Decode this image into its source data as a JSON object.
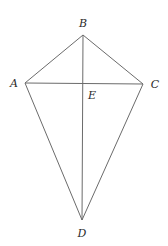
{
  "diagram": {
    "type": "kite",
    "points": {
      "A": {
        "label": "A",
        "x": 25,
        "y": 83,
        "label_x": 14,
        "label_y": 87
      },
      "B": {
        "label": "B",
        "x": 83,
        "y": 35,
        "label_x": 83,
        "label_y": 27
      },
      "C": {
        "label": "C",
        "x": 143,
        "y": 84,
        "label_x": 155,
        "label_y": 88
      },
      "D": {
        "label": "D",
        "x": 82,
        "y": 220,
        "label_x": 82,
        "label_y": 237
      },
      "E": {
        "label": "E",
        "x": 83,
        "y": 83,
        "label_x": 92,
        "label_y": 99
      }
    },
    "segments": [
      [
        "A",
        "B"
      ],
      [
        "B",
        "C"
      ],
      [
        "C",
        "D"
      ],
      [
        "D",
        "A"
      ],
      [
        "A",
        "C"
      ],
      [
        "B",
        "D"
      ]
    ],
    "line_color": "#6b6b6b",
    "label_color": "#2a2a2a"
  }
}
